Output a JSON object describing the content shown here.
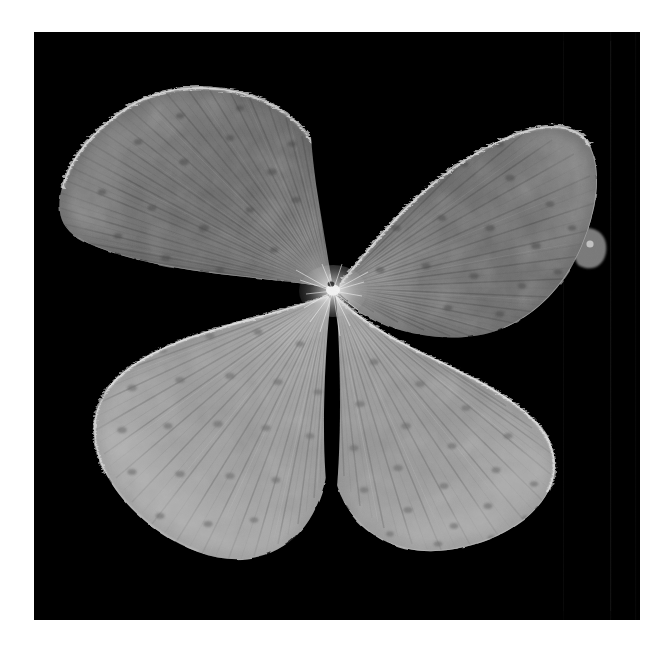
{
  "image": {
    "domain": "Natural-Image",
    "subject": "four-leaflet clover leaf",
    "description": "Grayscale close-up photograph of a pressed four-leaflet clover (Trifolium) leaf arranged as four fan-shaped leaflets radiating from a central point, photographed on a pure black background with a white page margin.",
    "medium": "monochrome photograph",
    "orientation": "square",
    "canvas": {
      "width": 667,
      "height": 671,
      "background_color": "#ffffff"
    },
    "photo_area": {
      "x": 34,
      "y": 32,
      "width": 606,
      "height": 588,
      "background_color": "#000000"
    },
    "palette": {
      "page_white": "#ffffff",
      "photo_black": "#000000",
      "leaf_dark": "#4a4a4a",
      "leaf_mid": "#6e6e6e",
      "leaf_light": "#9a9a9a",
      "leaf_bright": "#c8c8c8",
      "rim_highlight": "#e8e8e8",
      "vein_dark": "#3c3c3c",
      "speckle": "#555555"
    },
    "center_point": {
      "x": 330,
      "y": 292
    },
    "leaflets": [
      {
        "name": "upper-left-leaflet",
        "position": "upper left",
        "tone": "dark",
        "base_color": "#6a6a6a",
        "apex": {
          "x": 330,
          "y": 288
        },
        "extent": {
          "left": 62,
          "top": 88,
          "right": 330,
          "bottom": 330
        },
        "notes": "Broad fan with dense radiating veins, darkest of the four leaflets, fine marginal hairs along the upper-right rim."
      },
      {
        "name": "upper-right-leaflet",
        "position": "upper right",
        "tone": "dark",
        "base_color": "#6c6c6c",
        "apex": {
          "x": 336,
          "y": 288
        },
        "extent": {
          "left": 336,
          "top": 96,
          "right": 596,
          "bottom": 350
        },
        "notes": "Largest leaflet, extends furthest right, a small rounded lobe protrudes at the right margin near y=325."
      },
      {
        "name": "lower-left-leaflet",
        "position": "lower left",
        "tone": "light",
        "base_color": "#9a9a9a",
        "apex": {
          "x": 328,
          "y": 296
        },
        "extent": {
          "left": 86,
          "top": 330,
          "right": 330,
          "bottom": 558
        },
        "notes": "Brightest leaflet, rounded outline, visible dark glandular speckles scattered across the blade."
      },
      {
        "name": "lower-right-leaflet",
        "position": "lower right",
        "tone": "light",
        "base_color": "#969696",
        "apex": {
          "x": 336,
          "y": 296
        },
        "extent": {
          "left": 336,
          "top": 306,
          "right": 570,
          "bottom": 552
        },
        "notes": "Overlaps the upper-right leaflet along a bright curved margin; pale blade with radiating veins and speckles."
      }
    ],
    "features": [
      {
        "name": "central-gap-upper",
        "description": "Dark V-shaped wedge separating the two upper leaflets, narrowing to the central point."
      },
      {
        "name": "central-gap-lower",
        "description": "Narrow dark wedge separating the two lower leaflets, widening toward the bottom."
      },
      {
        "name": "marginal-hairs",
        "description": "Fine pale cilia fringing the leaflet margins, brightest on the upper rims."
      },
      {
        "name": "radiating-venation",
        "description": "Fan of fine parallel veins spreading from the central point to each leaflet margin."
      },
      {
        "name": "right-edge-lobe",
        "description": "Small rounded protrusion on the right margin of the upper-right leaflet."
      },
      {
        "name": "film-seam-lines",
        "description": "Faint vertical tonal seams in the black background near the right side of the frame."
      }
    ]
  }
}
